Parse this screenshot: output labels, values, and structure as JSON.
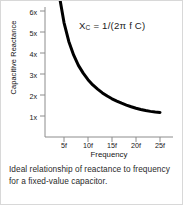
{
  "figure": {
    "caption": "Ideal relationship of reactance to frequency for a fixed-value capacitor.",
    "formula": {
      "variable": "X",
      "subscript": "C",
      "expression": " = 1/(2π f C)",
      "full_text": "XC = 1/(2π f C)"
    },
    "border_color": "#d8d8d8",
    "background_color": "#ffffff"
  },
  "chart_data": {
    "type": "line",
    "title": "",
    "xlabel": "Frequency",
    "ylabel": "Capacitive Reactance",
    "curve_color": "#000000",
    "axis_color": "#8a8a8a",
    "grid": false,
    "legend": null,
    "x_tick_labels": [
      "5f",
      "10f",
      "15f",
      "20f",
      "25f"
    ],
    "x_tick_values": [
      5,
      10,
      15,
      20,
      25
    ],
    "y_tick_labels": [
      "1x",
      "2x",
      "3x",
      "4x",
      "5x",
      "6x"
    ],
    "y_tick_values": [
      1,
      2,
      3,
      4,
      5,
      6
    ],
    "xlim": [
      0,
      27
    ],
    "ylim": [
      0,
      6.5
    ],
    "series": [
      {
        "name": "Xc = 1/(2π f C)",
        "x": [
          4.2,
          5,
          6,
          7,
          8,
          9,
          10,
          11,
          12,
          13,
          14,
          15,
          16,
          17,
          18,
          19,
          20,
          21,
          22,
          23,
          24,
          25
        ],
        "y": [
          6.5,
          5.45,
          4.55,
          3.91,
          3.41,
          3.04,
          2.73,
          2.48,
          2.28,
          2.1,
          1.95,
          1.82,
          1.71,
          1.61,
          1.52,
          1.44,
          1.37,
          1.31,
          1.26,
          1.22,
          1.19,
          1.17
        ]
      }
    ]
  }
}
